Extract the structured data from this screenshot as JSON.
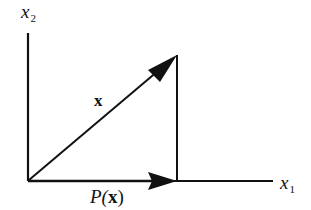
{
  "diagram": {
    "type": "vector-projection",
    "axes": {
      "horizontal": {
        "label_base": "x",
        "label_sub": "1"
      },
      "vertical": {
        "label_base": "x",
        "label_sub": "2"
      }
    },
    "vectors": {
      "x": {
        "label": "x"
      },
      "projection": {
        "label_func": "P(",
        "label_arg": "x",
        "label_close": ")"
      }
    },
    "colors": {
      "stroke": "#111111",
      "background": "#ffffff"
    }
  }
}
